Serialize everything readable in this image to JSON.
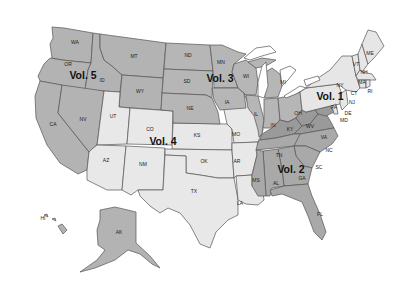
{
  "map": {
    "title": "US states grouped into volumes",
    "colors": {
      "vol1": "#e6e6e6",
      "vol2": "#a9a9a9",
      "vol2_dark": "#9a9a9a",
      "vol3": "#b6b6b6",
      "vol4": "#e8e8e8",
      "vol5": "#b3b3b3",
      "border": "#555555",
      "background": "#ffffff"
    },
    "volumes": [
      {
        "label": "Vol. 1",
        "states": [
          "ME",
          "NH",
          "VT",
          "MA",
          "RI",
          "CT",
          "NY",
          "NJ",
          "PA",
          "DE"
        ]
      },
      {
        "label": "Vol. 2",
        "states": [
          "MD",
          "VA",
          "WV",
          "KY",
          "TN",
          "NC",
          "SC",
          "GA",
          "FL",
          "AL",
          "MS"
        ]
      },
      {
        "label": "Vol. 3",
        "states": [
          "ND",
          "SD",
          "NE",
          "MN",
          "IA",
          "WI",
          "IL",
          "MI",
          "IN",
          "OH"
        ]
      },
      {
        "label": "Vol. 4",
        "states": [
          "UT",
          "CO",
          "AZ",
          "NM",
          "KS",
          "OK",
          "TX",
          "MO",
          "AR",
          "LA"
        ]
      },
      {
        "label": "Vol. 5",
        "states": [
          "WA",
          "OR",
          "ID",
          "MT",
          "WY",
          "CA",
          "NV",
          "AK",
          "HI"
        ]
      }
    ],
    "state_labels": {
      "WA": "WA",
      "OR": "OR",
      "ID": "ID",
      "MT": "MT",
      "WY": "WY",
      "CA": "CA",
      "NV": "NV",
      "UT": "UT",
      "CO": "CO",
      "AZ": "AZ",
      "NM": "NM",
      "ND": "ND",
      "SD": "SD",
      "NE": "NE",
      "KS": "KS",
      "OK": "OK",
      "TX": "TX",
      "MN": "MN",
      "IA": "IA",
      "MO": "MO",
      "AR": "AR",
      "LA": "LA",
      "WI": "WI",
      "IL": "IL",
      "MI": "MI",
      "IN": "IN",
      "OH": "OH",
      "KY": "KY",
      "TN": "TN",
      "MS": "MS",
      "AL": "AL",
      "GA": "GA",
      "FL": "FL",
      "SC": "SC",
      "NC": "NC",
      "VA": "VA",
      "WV": "WV",
      "PA": "PA",
      "NY": "NY",
      "VT": "VT",
      "NH": "NH",
      "ME": "ME",
      "MA": "MA",
      "RI": "RI",
      "CT": "CT",
      "NJ": "NJ",
      "DE": "DE",
      "MD": "MD",
      "AK": "AK",
      "HI": "HI"
    }
  }
}
